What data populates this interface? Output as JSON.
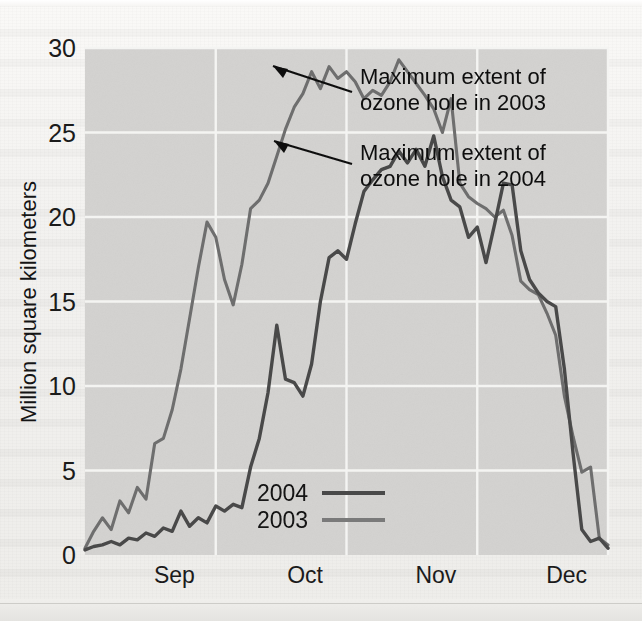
{
  "chart_data": {
    "type": "line",
    "title": "",
    "xlabel": "",
    "ylabel": "Million square kilometers",
    "ylim": [
      0,
      30
    ],
    "yticks": [
      0,
      5,
      10,
      15,
      20,
      25,
      30
    ],
    "xticks": [
      "Sep",
      "Oct",
      "Nov",
      "Dec"
    ],
    "xlim_days": [
      0,
      120
    ],
    "grid": true,
    "legend_position": "inside-bottom-center",
    "series": [
      {
        "name": "2004",
        "color": "#4a4a4a",
        "x": [
          0,
          2,
          4,
          6,
          8,
          10,
          12,
          14,
          16,
          18,
          20,
          22,
          24,
          26,
          28,
          30,
          32,
          34,
          36,
          38,
          40,
          42,
          44,
          45,
          46,
          48,
          50,
          52,
          54,
          56,
          58,
          60,
          62,
          64,
          66,
          68,
          70,
          72,
          74,
          76,
          78,
          80,
          82,
          84,
          86,
          88,
          90,
          92,
          94,
          96,
          98,
          100,
          102,
          104,
          106,
          108,
          110,
          112,
          114,
          116,
          118,
          120
        ],
        "values": [
          0.3,
          0.5,
          0.6,
          0.8,
          0.6,
          1.0,
          0.9,
          1.3,
          1.1,
          1.6,
          1.4,
          2.6,
          1.7,
          2.2,
          1.9,
          2.9,
          2.6,
          3.0,
          2.8,
          5.2,
          6.9,
          9.6,
          13.6,
          12.0,
          10.4,
          10.2,
          9.4,
          11.3,
          15.0,
          17.6,
          18.0,
          17.5,
          19.6,
          21.5,
          22.2,
          22.8,
          23.0,
          23.9,
          23.2,
          24.0,
          23.0,
          24.8,
          22.4,
          21.0,
          20.6,
          18.8,
          19.4,
          17.3,
          19.6,
          22.0,
          21.9,
          18.0,
          16.3,
          15.5,
          15.0,
          14.7,
          11.0,
          6.0,
          1.5,
          0.8,
          1.0,
          0.4
        ]
      },
      {
        "name": "2003",
        "color": "#6e6e6e",
        "x": [
          0,
          2,
          4,
          6,
          8,
          10,
          12,
          14,
          16,
          18,
          20,
          22,
          24,
          26,
          28,
          30,
          32,
          34,
          36,
          38,
          40,
          42,
          44,
          46,
          48,
          50,
          52,
          54,
          56,
          58,
          60,
          62,
          64,
          66,
          68,
          70,
          72,
          74,
          76,
          78,
          80,
          82,
          84,
          86,
          88,
          90,
          92,
          94,
          96,
          98,
          100,
          102,
          104,
          106,
          108,
          110,
          112,
          114,
          116,
          118,
          120
        ],
        "values": [
          0.4,
          1.4,
          2.2,
          1.5,
          3.2,
          2.5,
          4.0,
          3.3,
          6.6,
          6.9,
          8.6,
          11.0,
          14.0,
          17.0,
          19.7,
          18.8,
          16.3,
          14.8,
          17.2,
          20.5,
          21.0,
          22.0,
          23.6,
          25.2,
          26.5,
          27.3,
          28.6,
          27.6,
          28.9,
          28.2,
          28.6,
          28.0,
          27.0,
          27.5,
          27.2,
          28.0,
          29.3,
          28.6,
          27.9,
          27.2,
          26.4,
          25.0,
          27.0,
          22.0,
          21.2,
          20.8,
          20.5,
          20.0,
          20.4,
          18.9,
          16.2,
          15.7,
          15.4,
          14.3,
          13.0,
          9.4,
          7.0,
          4.9,
          5.2,
          1.0,
          0.6
        ]
      }
    ],
    "annotations": [
      {
        "id": "max-2003",
        "line1": "Maximum extent of",
        "line2": "ozone hole in 2003"
      },
      {
        "id": "max-2004",
        "line1": "Maximum extent of",
        "line2": "ozone hole in 2004"
      }
    ]
  },
  "colors": {
    "plot_background": "#d3d2d0",
    "gridline": "#f4f4f2",
    "text": "#141414",
    "series_2004": "#4a4a4a",
    "series_2003": "#6e6e6e"
  }
}
